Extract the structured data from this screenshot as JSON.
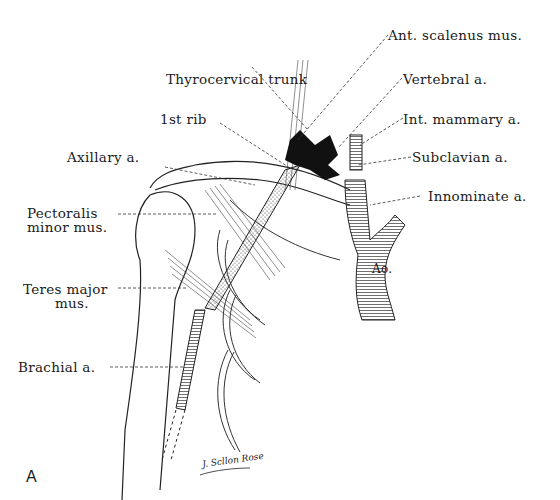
{
  "figure": {
    "panel_letter": "A",
    "signature": "J. Scllon Rose",
    "aorta_label": "Ao.",
    "labels": [
      {
        "id": "ant-scalenus",
        "text": "Ant. scalenus mus."
      },
      {
        "id": "thyrocervical",
        "text": "Thyrocervical trunk"
      },
      {
        "id": "vertebral",
        "text": "Vertebral a."
      },
      {
        "id": "first-rib",
        "text": "1st rib"
      },
      {
        "id": "int-mammary",
        "text": "Int. mammary a."
      },
      {
        "id": "axillary",
        "text": "Axillary a."
      },
      {
        "id": "subclavian",
        "text": "Subclavian a."
      },
      {
        "id": "innominate",
        "text": "Innominate a."
      },
      {
        "id": "pectoralis-1",
        "text": "Pectoralis"
      },
      {
        "id": "pectoralis-2",
        "text": "minor mus."
      },
      {
        "id": "teres-1",
        "text": "Teres major"
      },
      {
        "id": "teres-2",
        "text": "mus."
      },
      {
        "id": "brachial",
        "text": "Brachial a."
      }
    ]
  }
}
